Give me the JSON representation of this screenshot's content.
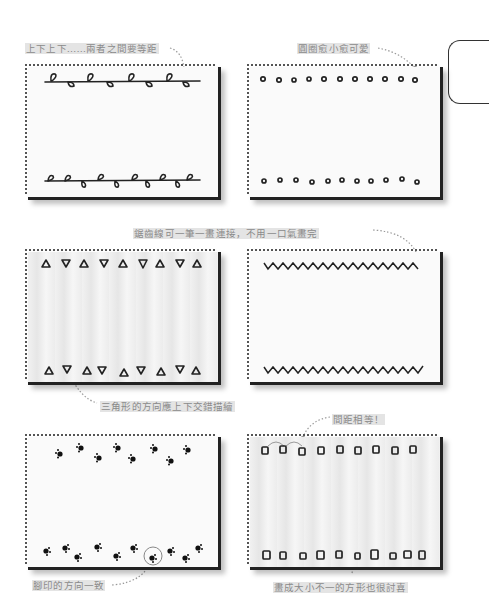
{
  "page": {
    "annotations": {
      "vine_spacing": "上下上下……兩者之間要等距",
      "circles_small": "圓圈愈小愈可愛",
      "zigzag_strokes": "鋸齒線可一筆一畫連接，不用一口氣畫完",
      "triangles_alternate": "三角形的方向應上下交錯描繪",
      "equal_spacing": "間距相等！",
      "paw_direction": "腳印的方向一致",
      "squares_varied": "畫成大小不一的方形也很討喜"
    },
    "panels": [
      {
        "id": "vine",
        "pattern": "leaf-vine-border",
        "position": "top-left"
      },
      {
        "id": "circles",
        "pattern": "small-circle-border",
        "position": "top-right"
      },
      {
        "id": "triangles",
        "pattern": "alternating-triangle-border",
        "position": "middle-left"
      },
      {
        "id": "zigzag",
        "pattern": "zigzag-line-border",
        "position": "middle-right"
      },
      {
        "id": "paws",
        "pattern": "paw-print-border",
        "position": "bottom-left"
      },
      {
        "id": "squares",
        "pattern": "square-border",
        "position": "bottom-right"
      }
    ],
    "colors": {
      "ink": "#222222",
      "annotation_text": "#8a8a8a",
      "leader_line": "#9a9a9a",
      "panel_shadow": "#222222"
    }
  }
}
